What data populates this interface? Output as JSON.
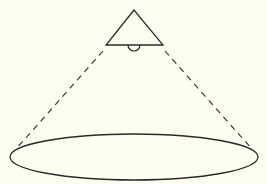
{
  "diagram": {
    "colors": {
      "background": "#fdfdf0",
      "stroke": "#2a2a2a"
    },
    "lamp": {
      "shape": "triangle",
      "apex": [
        134,
        10
      ],
      "base_left": [
        106,
        45
      ],
      "base_right": [
        163,
        45
      ],
      "bulb": {
        "cx": 134,
        "cy": 45,
        "r": 6
      }
    },
    "beams": [
      {
        "from": [
          103,
          51
        ],
        "to": [
          16,
          149
        ],
        "style": "dashed"
      },
      {
        "from": [
          165,
          51
        ],
        "to": [
          252,
          149
        ],
        "style": "dashed"
      }
    ],
    "light_area": {
      "shape": "ellipse",
      "cx": 134,
      "cy": 157,
      "rx": 124,
      "ry": 23
    }
  }
}
